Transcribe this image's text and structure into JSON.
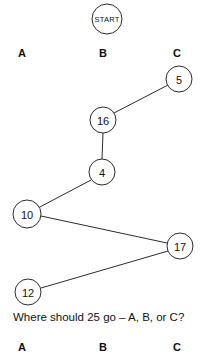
{
  "diagram": {
    "title_node": {
      "label": "START",
      "cx": 107,
      "cy": 19,
      "r": 15
    },
    "top_column_labels": [
      {
        "label": "A",
        "x": 22,
        "y": 53
      },
      {
        "label": "B",
        "x": 103,
        "y": 53
      },
      {
        "label": "C",
        "x": 177,
        "y": 53
      }
    ],
    "nodes": [
      {
        "id": "n5",
        "label": "5",
        "cx": 179,
        "cy": 79,
        "r": 13
      },
      {
        "id": "n16",
        "label": "16",
        "cx": 103,
        "cy": 120,
        "r": 13
      },
      {
        "id": "n4",
        "label": "4",
        "cx": 102,
        "cy": 172,
        "r": 13
      },
      {
        "id": "n10",
        "label": "10",
        "cx": 27,
        "cy": 214,
        "r": 14
      },
      {
        "id": "n17",
        "label": "17",
        "cx": 180,
        "cy": 246,
        "r": 13
      },
      {
        "id": "n12",
        "label": "12",
        "cx": 28,
        "cy": 292,
        "r": 13
      }
    ],
    "edges": [
      {
        "from": "n16",
        "to": "n5",
        "x1": 114,
        "y1": 113,
        "x2": 168,
        "y2": 85
      },
      {
        "from": "n16",
        "to": "n4",
        "x1": 103,
        "y1": 133,
        "x2": 102,
        "y2": 159
      },
      {
        "from": "n4",
        "to": "n10",
        "x1": 91,
        "y1": 180,
        "x2": 38,
        "y2": 208
      },
      {
        "from": "n10",
        "to": "n17",
        "x1": 41,
        "y1": 216,
        "x2": 167,
        "y2": 243
      },
      {
        "from": "n17",
        "to": "n12",
        "x1": 168,
        "y1": 251,
        "x2": 41,
        "y2": 288
      }
    ]
  },
  "question": {
    "text": "Where should 25 go – A, B, or C?"
  },
  "answer_options": [
    {
      "label": "A",
      "x": 22,
      "y": 347
    },
    {
      "label": "B",
      "x": 103,
      "y": 347
    },
    {
      "label": "C",
      "x": 177,
      "y": 347
    }
  ],
  "colors": {
    "background": "#ffffff",
    "stroke": "#2b2b2b",
    "text": "#111111"
  }
}
